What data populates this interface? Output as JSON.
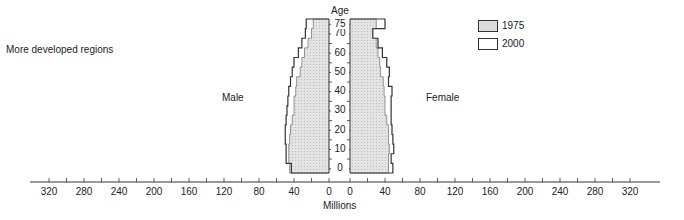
{
  "chart_data": {
    "type": "bar",
    "subtype": "population-pyramid",
    "title": "More developed regions",
    "xlabel": "Millions",
    "ylabel": "Age",
    "left_label": "Male",
    "right_label": "Female",
    "x_ticks": [
      320,
      280,
      240,
      200,
      160,
      120,
      80,
      40,
      0
    ],
    "xlim": [
      0,
      340
    ],
    "age_ticks": [
      "0",
      "10",
      "20",
      "30",
      "40",
      "50",
      "60",
      "70",
      "75+"
    ],
    "categories": [
      "0-4",
      "5-9",
      "10-14",
      "15-19",
      "20-24",
      "25-29",
      "30-34",
      "35-39",
      "40-44",
      "45-49",
      "50-54",
      "55-59",
      "60-64",
      "65-69",
      "70-74",
      "75+"
    ],
    "series": [
      {
        "name": "1975",
        "sex": "male",
        "style": "shaded",
        "values": [
          45,
          46,
          46,
          45,
          44,
          42,
          40,
          40,
          38,
          37,
          33,
          31,
          28,
          24,
          20,
          18
        ]
      },
      {
        "name": "2000",
        "sex": "male",
        "style": "outline",
        "values": [
          43,
          49,
          49,
          50,
          50,
          49,
          48,
          47,
          46,
          44,
          42,
          40,
          35,
          31,
          27,
          26
        ]
      },
      {
        "name": "1975",
        "sex": "female",
        "style": "shaded",
        "values": [
          44,
          44,
          45,
          44,
          44,
          42,
          40,
          40,
          39,
          38,
          35,
          34,
          32,
          30,
          26,
          30
        ]
      },
      {
        "name": "2000",
        "sex": "female",
        "style": "outline",
        "values": [
          49,
          47,
          50,
          49,
          48,
          47,
          47,
          47,
          48,
          44,
          45,
          42,
          37,
          32,
          26,
          40
        ]
      }
    ],
    "legend": [
      {
        "label": "1975",
        "style": "shaded"
      },
      {
        "label": "2000",
        "style": "outline"
      }
    ],
    "legend_position": "upper-right",
    "grid": false
  },
  "labels": {
    "region": "More developed regions",
    "age_axis": "Age",
    "millions": "Millions",
    "male": "Male",
    "female": "Female",
    "legend_1975": "1975",
    "legend_2000": "2000"
  },
  "colors": {
    "shade": "#d9d9d9",
    "line": "#333333",
    "text": "#222222"
  }
}
